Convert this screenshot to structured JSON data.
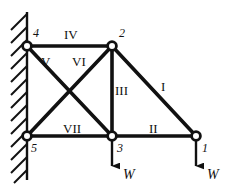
{
  "figure": {
    "background_color": "#ffffff",
    "line_color": "#111111",
    "node_fill_color": "#ffffff"
  },
  "support": {
    "type": "fixed-wall",
    "name": "hatched-wall",
    "wall_x": 27,
    "wall_y_top": 12,
    "wall_y_bottom": 180,
    "hatch_count": 13
  },
  "nodes": [
    {
      "id": "1",
      "label": "1",
      "x": 196,
      "y": 136,
      "label_x": 202,
      "label_y": 142
    },
    {
      "id": "2",
      "label": "2",
      "x": 112,
      "y": 46,
      "label_x": 119,
      "label_y": 27
    },
    {
      "id": "3",
      "label": "3",
      "x": 112,
      "y": 136,
      "label_x": 117,
      "label_y": 142
    },
    {
      "id": "4",
      "label": "4",
      "x": 27,
      "y": 46,
      "label_x": 33,
      "label_y": 27
    },
    {
      "id": "5",
      "label": "5",
      "x": 27,
      "y": 136,
      "label_x": 31,
      "label_y": 142
    }
  ],
  "members": [
    {
      "id": "I",
      "label": "I",
      "from": "2",
      "to": "1",
      "label_x": 161,
      "label_y": 80
    },
    {
      "id": "II",
      "label": "II",
      "from": "3",
      "to": "1",
      "label_x": 149,
      "label_y": 122
    },
    {
      "id": "III",
      "label": "III",
      "from": "2",
      "to": "3",
      "label_x": 115,
      "label_y": 84
    },
    {
      "id": "IV",
      "label": "IV",
      "from": "4",
      "to": "2",
      "label_x": 64,
      "label_y": 28
    },
    {
      "id": "V",
      "label": "V",
      "from": "4",
      "to": "3",
      "label_x": 41,
      "label_y": 55
    },
    {
      "id": "VI",
      "label": "VI",
      "from": "2",
      "to": "5",
      "label_x": 72,
      "label_y": 55
    },
    {
      "id": "VII",
      "label": "VII",
      "from": "5",
      "to": "3",
      "label_x": 63,
      "label_y": 122
    }
  ],
  "loads": [
    {
      "id": "load-node-3",
      "label": "W",
      "at_node": "3",
      "x": 112,
      "y_start": 140,
      "y_end": 168,
      "label_x": 123,
      "label_y": 168
    },
    {
      "id": "load-node-1",
      "label": "W",
      "at_node": "1",
      "x": 196,
      "y_start": 140,
      "y_end": 168,
      "label_x": 207,
      "label_y": 168
    }
  ]
}
